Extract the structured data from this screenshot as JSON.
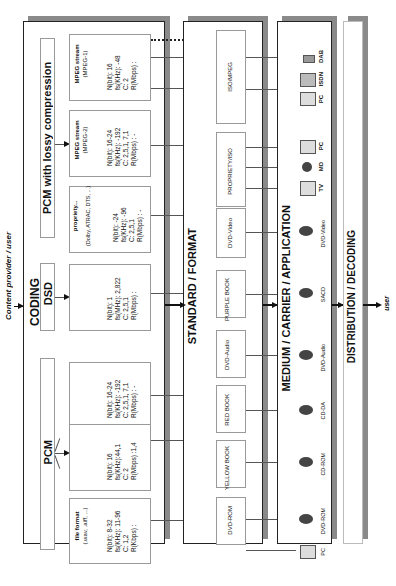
{
  "diagram": {
    "input_label": "Content provider / user",
    "output_label": "user",
    "coding": {
      "title": "CODING",
      "groups": {
        "pcm": "PCM",
        "dsd": "DSD",
        "lossy": "PCM with lossy compression"
      },
      "boxes": [
        {
          "id": "file-format",
          "title": "file format",
          "subtitle": "(.wav, .aiff, ...)",
          "n": "N(bit):  8-32",
          "f": "fs(KHz): 11-96",
          "c": "C: 1,2",
          "r": "R(Kbps) :"
        },
        {
          "id": "pcm-cd",
          "title": "",
          "subtitle": "",
          "n": "N(bit):  16",
          "f": "fs(KHz):44,1",
          "c": "C: 2",
          "r": "R(Mbps) :1,4"
        },
        {
          "id": "pcm-dvd",
          "title": "",
          "subtitle": "",
          "n": "N(bit):  16-24",
          "f": "fs(KHz): -192",
          "c": "C: 2,5,1, 7,1",
          "r": "R(Mbps) : -"
        },
        {
          "id": "dsd",
          "title": "",
          "subtitle": "",
          "n": "N(bit):  1",
          "f": "fs(MHz): 2,822",
          "c": "C: 2,5,1",
          "r": "R(Mbps) :"
        },
        {
          "id": "propriety",
          "title": "propriety...",
          "subtitle": "(Dolby, ATRAC, DTS, ...)",
          "n": "N(bit):  -24",
          "f": "fs(KHz): -96",
          "c": "C: 2,5,1",
          "r": "R(Mbps) : -"
        },
        {
          "id": "mpeg2",
          "title": "MPEG stream",
          "subtitle": "(MPEG-2)",
          "n": "N(bit):  16-24",
          "f": "fs(KHz): -192",
          "c": "C: 2,5,1, 7,1",
          "r": "R(Mbps) : -"
        },
        {
          "id": "mpeg1",
          "title": "MPEG stream",
          "subtitle": "(MPEG-1)",
          "n": "N(bit):  16",
          "f": "fs(KHz): -48",
          "c": "C: 2",
          "r": "R(Mbps) :"
        }
      ]
    },
    "standard": {
      "title": "STANDARD / FORMAT",
      "boxes": [
        "DVD-ROM",
        "YELLOW BOOK",
        "RED BOOK",
        "DVD-Audio",
        "PURPLE BOOK",
        "DVD-Video",
        "PROPRIETY/ISO",
        "ISO/MPEG"
      ]
    },
    "medium": {
      "title": "MEDIUM / CARRIER / APPLICATION",
      "items": [
        "PC",
        "DVD-ROM",
        "CD-ROM",
        "CD-DA",
        "DVD-Audio",
        "SACD",
        "DVD-Video",
        "TV",
        "MD",
        "PC",
        "PC",
        "ISDN",
        "DAB"
      ]
    },
    "distribution": {
      "title": "DISTRIBUTION / DECODING"
    }
  }
}
